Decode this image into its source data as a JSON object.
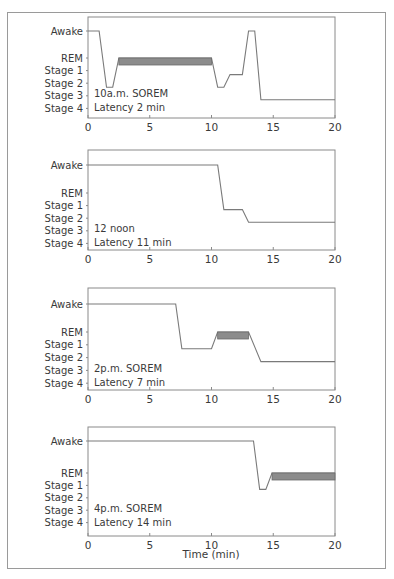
{
  "figure": {
    "xlabel": "Time (min)"
  },
  "colors": {
    "frame": "#9a9a9a",
    "axis": "#8a8a8a",
    "trace": "#7a7a7a",
    "rem_bar_fill": "#8c8c8c",
    "rem_bar_stroke": "#6a6a6a",
    "text": "#3a3a3a"
  },
  "chart_data": [
    {
      "type": "line",
      "title": "10a.m. SOREM",
      "annotation": [
        "10a.m. SOREM",
        "Latency 2 min"
      ],
      "xlabel": "",
      "ylabel": "",
      "xlim": [
        0,
        20
      ],
      "xticks": [
        0,
        5,
        10,
        15,
        20
      ],
      "yticks": [
        "Awake",
        "REM",
        "Stage 1",
        "Stage 2",
        "Stage 3",
        "Stage 4"
      ],
      "points": [
        [
          0,
          "Awake"
        ],
        [
          0.9,
          "Awake"
        ],
        [
          1.5,
          "Stage 2"
        ],
        [
          2.0,
          "Stage 2"
        ],
        [
          2.5,
          "REM"
        ],
        [
          10.0,
          "REM"
        ],
        [
          10.5,
          "Stage 2"
        ],
        [
          11.0,
          "Stage 2"
        ],
        [
          11.5,
          "Stage 1"
        ],
        [
          12.5,
          "Stage 1"
        ],
        [
          13.0,
          "Awake"
        ],
        [
          13.5,
          "Awake"
        ],
        [
          14.0,
          "Stage 3"
        ],
        [
          20,
          "Stage 3"
        ]
      ],
      "rem_periods": [
        [
          2.5,
          10.0
        ]
      ],
      "latency_min": 2
    },
    {
      "type": "line",
      "title": "12 noon",
      "annotation": [
        "12 noon",
        "Latency 11 min"
      ],
      "xlabel": "",
      "ylabel": "",
      "xlim": [
        0,
        20
      ],
      "xticks": [
        0,
        5,
        10,
        15,
        20
      ],
      "yticks": [
        "Awake",
        "REM",
        "Stage 1",
        "Stage 2",
        "Stage 3",
        "Stage 4"
      ],
      "points": [
        [
          0,
          "Awake"
        ],
        [
          10.5,
          "Awake"
        ],
        [
          11.0,
          "Stage 1"
        ],
        [
          12.5,
          "Stage 1"
        ],
        [
          13.0,
          "Stage 2"
        ],
        [
          20,
          "Stage 2"
        ]
      ],
      "rem_periods": [],
      "latency_min": 11
    },
    {
      "type": "line",
      "title": "2p.m. SOREM",
      "annotation": [
        "2p.m. SOREM",
        "Latency 7 min"
      ],
      "xlabel": "",
      "ylabel": "",
      "xlim": [
        0,
        20
      ],
      "xticks": [
        0,
        5,
        10,
        15,
        20
      ],
      "yticks": [
        "Awake",
        "REM",
        "Stage 1",
        "Stage 2",
        "Stage 3",
        "Stage 4"
      ],
      "points": [
        [
          0,
          "Awake"
        ],
        [
          7.1,
          "Awake"
        ],
        [
          7.6,
          "Stage 1"
        ],
        [
          10.0,
          "Stage 1"
        ],
        [
          10.5,
          "REM"
        ],
        [
          13.0,
          "REM"
        ],
        [
          14.0,
          "Stage 2"
        ],
        [
          20,
          "Stage 2"
        ]
      ],
      "rem_periods": [
        [
          10.5,
          13.0
        ]
      ],
      "latency_min": 7
    },
    {
      "type": "line",
      "title": "4p.m. SOREM",
      "annotation": [
        "4p.m. SOREM",
        "Latency 14 min"
      ],
      "xlabel": "Time (min)",
      "ylabel": "",
      "xlim": [
        0,
        20
      ],
      "xticks": [
        0,
        5,
        10,
        15,
        20
      ],
      "yticks": [
        "Awake",
        "REM",
        "Stage 1",
        "Stage 2",
        "Stage 3",
        "Stage 4"
      ],
      "points": [
        [
          0,
          "Awake"
        ],
        [
          13.4,
          "Awake"
        ],
        [
          13.9,
          "Stage 1"
        ],
        [
          14.4,
          "Stage 1"
        ],
        [
          14.9,
          "REM"
        ],
        [
          20,
          "REM"
        ]
      ],
      "rem_periods": [
        [
          14.9,
          20.0
        ]
      ],
      "latency_min": 14
    }
  ]
}
